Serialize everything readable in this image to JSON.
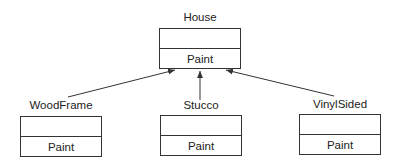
{
  "diagram": {
    "type": "uml-class-inheritance",
    "parent": {
      "name": "House",
      "attributes": [],
      "operations": [
        "Paint"
      ]
    },
    "children": [
      {
        "name": "WoodFrame",
        "attributes": [],
        "operations": [
          "Paint"
        ]
      },
      {
        "name": "Stucco",
        "attributes": [],
        "operations": [
          "Paint"
        ]
      },
      {
        "name": "VinylSided",
        "attributes": [],
        "operations": [
          "Paint"
        ]
      }
    ],
    "relationships": [
      {
        "from": "WoodFrame",
        "to": "House",
        "kind": "generalization"
      },
      {
        "from": "Stucco",
        "to": "House",
        "kind": "generalization"
      },
      {
        "from": "VinylSided",
        "to": "House",
        "kind": "generalization"
      }
    ]
  },
  "colors": {
    "line": "#333333",
    "text": "#222222",
    "background": "#ffffff"
  }
}
